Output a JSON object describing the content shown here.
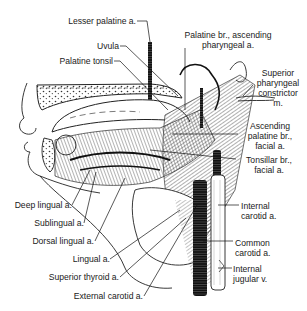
{
  "figure": {
    "colors": {
      "ink": "#1a1a1a",
      "background": "#ffffff"
    }
  },
  "labels": {
    "lesser_palatine": "Lesser palatine a.",
    "uvula": "Uvula",
    "palatine_tonsil": "Palatine tonsil",
    "palatine_br_line1": "Palatine br., ascending",
    "palatine_br_line2": "pharyngeal a.",
    "sup_constrictor_line1": "Superior",
    "sup_constrictor_line2": "pharyngeal",
    "sup_constrictor_line3": "constrictor",
    "sup_constrictor_line4": "m.",
    "asc_palatine_line1": "Ascending",
    "asc_palatine_line2": "palatine br.,",
    "asc_palatine_line3": "facial a.",
    "tonsillar_line1": "Tonsillar br.,",
    "tonsillar_line2": "facial a.",
    "internal_carotid_line1": "Internal",
    "internal_carotid_line2": "carotid a.",
    "common_carotid_line1": "Common",
    "common_carotid_line2": "carotid a.",
    "internal_jugular_line1": "Internal",
    "internal_jugular_line2": "jugular v.",
    "deep_lingual": "Deep lingual a.",
    "sublingual": "Sublingual a.",
    "dorsal_lingual": "Dorsal lingual a.",
    "lingual": "Lingual a.",
    "superior_thyroid": "Superior thyroid a.",
    "external_carotid": "External carotid a."
  }
}
